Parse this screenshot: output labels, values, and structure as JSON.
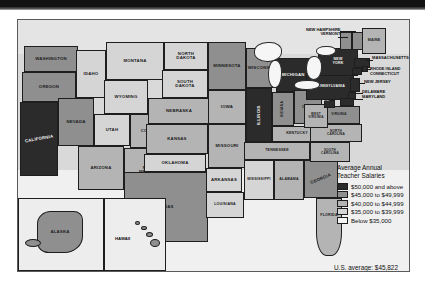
{
  "banner": {
    "present": true
  },
  "map": {
    "title": "United States Average Annual Teacher Salaries map",
    "legend": {
      "title_line1": "Average Annual",
      "title_line2": "Teacher Salaries",
      "items": [
        {
          "label": "$50,000 and above",
          "color": "#2b2b2b"
        },
        {
          "label": "$45,000 to $49,999",
          "color": "#8f8f8f"
        },
        {
          "label": "$40,000 to $44,999",
          "color": "#b4b4b4"
        },
        {
          "label": "$35,000 to $39,999",
          "color": "#d5d5d5"
        },
        {
          "label": "Below $35,000",
          "color": "#f4f4f4"
        }
      ]
    },
    "us_average": "U.S. average:  $45,822",
    "states": [
      {
        "name": "WASHINGTON",
        "tier": 2
      },
      {
        "name": "OREGON",
        "tier": 2
      },
      {
        "name": "CALIFORNIA",
        "tier": 1
      },
      {
        "name": "NEVADA",
        "tier": 2
      },
      {
        "name": "IDAHO",
        "tier": 4
      },
      {
        "name": "MONTANA",
        "tier": 4
      },
      {
        "name": "WYOMING",
        "tier": 4
      },
      {
        "name": "UTAH",
        "tier": 4
      },
      {
        "name": "ARIZONA",
        "tier": 3
      },
      {
        "name": "COLORADO",
        "tier": 3
      },
      {
        "name": "NEW MEXICO",
        "tier": 3
      },
      {
        "name": "NORTH DAKOTA",
        "tier": 4
      },
      {
        "name": "SOUTH DAKOTA",
        "tier": 4
      },
      {
        "name": "NEBRASKA",
        "tier": 3
      },
      {
        "name": "KANSAS",
        "tier": 3
      },
      {
        "name": "OKLAHOMA",
        "tier": 4
      },
      {
        "name": "TEXAS",
        "tier": 2
      },
      {
        "name": "MINNESOTA",
        "tier": 2
      },
      {
        "name": "IOWA",
        "tier": 3
      },
      {
        "name": "MISSOURI",
        "tier": 3
      },
      {
        "name": "ARKANSAS",
        "tier": 4
      },
      {
        "name": "LOUISIANA",
        "tier": 4
      },
      {
        "name": "WISCONSIN",
        "tier": 2
      },
      {
        "name": "ILLINOIS",
        "tier": 1
      },
      {
        "name": "MICHIGAN",
        "tier": 1
      },
      {
        "name": "INDIANA",
        "tier": 2
      },
      {
        "name": "OHIO",
        "tier": 2
      },
      {
        "name": "KENTUCKY",
        "tier": 3
      },
      {
        "name": "TENNESSEE",
        "tier": 3
      },
      {
        "name": "MISSISSIPPI",
        "tier": 4
      },
      {
        "name": "ALABAMA",
        "tier": 3
      },
      {
        "name": "GEORGIA",
        "tier": 2
      },
      {
        "name": "FLORIDA",
        "tier": 3
      },
      {
        "name": "SOUTH CAROLINA",
        "tier": 3
      },
      {
        "name": "NORTH CAROLINA",
        "tier": 3
      },
      {
        "name": "VIRGINIA",
        "tier": 2
      },
      {
        "name": "WEST VIRGINIA",
        "tier": 3
      },
      {
        "name": "D.C.",
        "tier": 1
      },
      {
        "name": "MARYLAND",
        "tier": 1
      },
      {
        "name": "DELAWARE",
        "tier": 1
      },
      {
        "name": "PENNSYLVANIA",
        "tier": 1
      },
      {
        "name": "NEW JERSEY",
        "tier": 1
      },
      {
        "name": "NEW YORK",
        "tier": 1
      },
      {
        "name": "CONNECTICUT",
        "tier": 1
      },
      {
        "name": "RHODE ISLAND",
        "tier": 1
      },
      {
        "name": "MASSACHUSETTS",
        "tier": 1
      },
      {
        "name": "VERMONT",
        "tier": 2
      },
      {
        "name": "NEW HAMPSHIRE",
        "tier": 2
      },
      {
        "name": "MAINE",
        "tier": 3
      },
      {
        "name": "ALASKA",
        "tier": 2
      },
      {
        "name": "HAWAII",
        "tier": 2
      }
    ],
    "callouts": [
      {
        "name": "NEW HAMPSHIRE"
      },
      {
        "name": "VERMONT"
      },
      {
        "name": "MAINE"
      },
      {
        "name": "MASSACHUSETTS"
      },
      {
        "name": "RHODE ISLAND"
      },
      {
        "name": "CONNECTICUT"
      },
      {
        "name": "NEW JERSEY"
      },
      {
        "name": "DELAWARE"
      },
      {
        "name": "MARYLAND"
      }
    ],
    "insets": [
      {
        "name": "ALASKA"
      },
      {
        "name": "HAWAII"
      }
    ]
  }
}
